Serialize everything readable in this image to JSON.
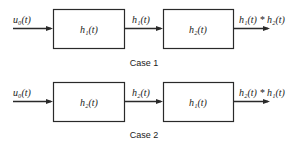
{
  "diagram": {
    "type": "block-diagram",
    "cases": [
      {
        "caption": "Case 1",
        "input": "u₀(t)",
        "blocks": [
          "h₁(t)",
          "h₂(t)"
        ],
        "intermediate": "h₁(t)",
        "output": "h₁(t) * h₂(t)"
      },
      {
        "caption": "Case 2",
        "input": "u₀(t)",
        "blocks": [
          "h₂(t)",
          "h₁(t)"
        ],
        "intermediate": "h₂(t)",
        "output": "h₂(t) * h₁(t)"
      }
    ]
  }
}
